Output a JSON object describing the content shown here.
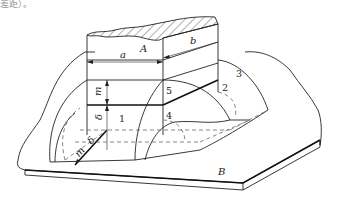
{
  "caption": "差距）。",
  "labels": {
    "A": "A",
    "B": "B",
    "a": "a",
    "b": "b",
    "m_vertical": "m",
    "delta_vertical": "δ",
    "m_diagonal": "m",
    "delta_diagonal": "δ"
  },
  "zones": [
    "1",
    "2",
    "3",
    "4",
    "5"
  ],
  "colors": {
    "line": "#222222",
    "hatch": "#333333",
    "background": "#ffffff"
  }
}
